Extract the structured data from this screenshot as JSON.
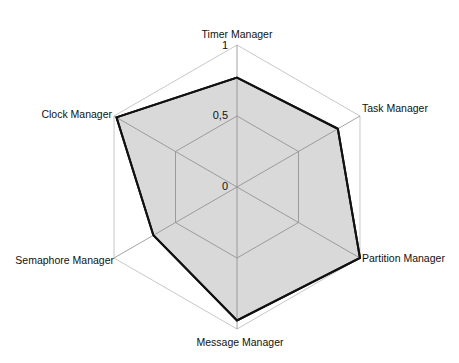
{
  "chart_data": {
    "type": "radar",
    "title": "",
    "categories": [
      "Timer Manager",
      "Task Manager",
      "Partition Manager",
      "Message Manager",
      "Semaphore Manager",
      "Clock Manager"
    ],
    "series": [
      {
        "name": "",
        "values": [
          0.77,
          0.82,
          1.0,
          0.94,
          0.68,
          0.98
        ]
      }
    ],
    "radial_ticks": [
      "0",
      "0,5",
      "1"
    ],
    "rlim": [
      0,
      1
    ],
    "grid": true,
    "legend": "none",
    "colors": {
      "fill": "#d9d9d9",
      "stroke": "#111111",
      "grid": "#8c8c8c",
      "outer": "#c8c8c8"
    }
  }
}
